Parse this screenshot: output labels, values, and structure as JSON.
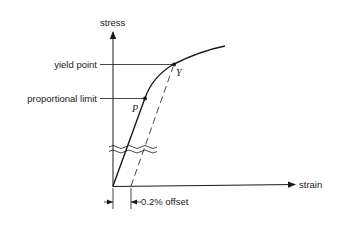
{
  "diagram": {
    "type": "stress-strain curve",
    "axes": {
      "y_label": "stress",
      "x_label": "strain"
    },
    "annotations": {
      "yield_label": "yield point",
      "proportional_label": "proportional limit",
      "offset_label": "0.2% offset"
    },
    "points": [
      {
        "symbol": "P",
        "meaning": "proportional limit"
      },
      {
        "symbol": "Y",
        "meaning": "yield point"
      }
    ],
    "colors": {
      "ink": "#1a1a1a",
      "background": "#ffffff"
    }
  }
}
